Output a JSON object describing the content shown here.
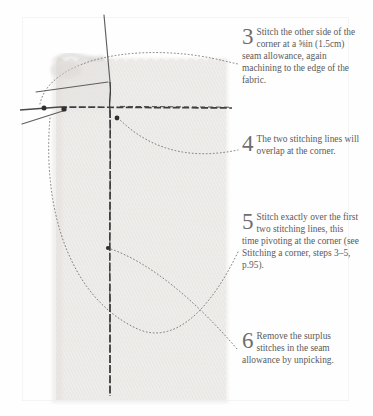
{
  "illustration": {
    "name": "fabric-corner-stitching-diagram",
    "fabric_color": "#eceae8",
    "stitch_color": "#3a3a3a",
    "leader_color": "#6e6e6e",
    "description": "Woven fabric swatch with two intersecting stitching lines forming a corner, loose threads and pivot dots",
    "elements": [
      "fabric-swatch",
      "horizontal-stitch-line",
      "vertical-stitch-line",
      "diagonal-thread",
      "vertical-thread",
      "pivot-dot-left",
      "pivot-dot-corner",
      "pivot-dot-inner",
      "leader-line-3",
      "leader-line-4",
      "leader-line-5",
      "leader-line-6"
    ]
  },
  "steps": [
    {
      "number": "3",
      "text": "Stitch the other side of the corner at a ⅝in (1.5cm) seam allowance, again machining to the edge of the fabric."
    },
    {
      "number": "4",
      "text": "The two stitching lines will overlap at the corner."
    },
    {
      "number": "5",
      "text": "Stitch exactly over the first two stitching lines, this time pivoting at the corner (see Stitching a corner, steps 3–5, p.95)."
    },
    {
      "number": "6",
      "text": "Remove the surplus stitches in the seam allowance by unpicking."
    }
  ]
}
